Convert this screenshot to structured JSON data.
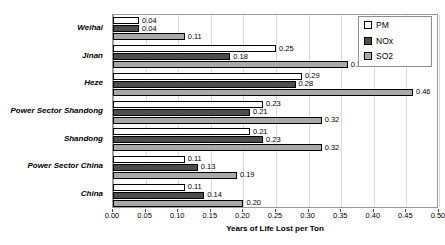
{
  "chart_data": {
    "type": "bar",
    "orientation": "horizontal",
    "title": "",
    "xlabel": "Years of Life Lost per Ton",
    "ylabel": "",
    "xlim": [
      0.0,
      0.5
    ],
    "xticks": [
      "0.00",
      "0.05",
      "0.10",
      "0.15",
      "0.20",
      "0.25",
      "0.30",
      "0.35",
      "0.40",
      "0.45",
      "0.50"
    ],
    "xtick_values": [
      0.0,
      0.05,
      0.1,
      0.15,
      0.2,
      0.25,
      0.3,
      0.35,
      0.4,
      0.45,
      0.5
    ],
    "grid": true,
    "legend_position": "top-right",
    "categories": [
      "Weihai",
      "Jinan",
      "Heze",
      "Power Sector Shandong",
      "Shandong",
      "Power Sector China",
      "China"
    ],
    "series": [
      {
        "name": "PM",
        "color": "#ffffff",
        "values": [
          0.04,
          0.25,
          0.29,
          0.23,
          0.21,
          0.11,
          0.11
        ],
        "labels": [
          "0.04",
          "0.25",
          "0.29",
          "0.23",
          "0.21",
          "0.11",
          "0.11"
        ]
      },
      {
        "name": "NOx",
        "color": "#4d4d4d",
        "values": [
          0.04,
          0.18,
          0.28,
          0.21,
          0.23,
          0.13,
          0.14
        ],
        "labels": [
          "0.04",
          "0.18",
          "0.28",
          "0.21",
          "0.23",
          "0.13",
          "0.14"
        ]
      },
      {
        "name": "SO2",
        "color": "#a9a9a9",
        "values": [
          0.11,
          0.36,
          0.46,
          0.32,
          0.32,
          0.19,
          0.2
        ],
        "labels": [
          "0.11",
          "0.36",
          "0.46",
          "0.32",
          "0.32",
          "0.19",
          "0.20"
        ]
      }
    ]
  },
  "legend": {
    "items": [
      {
        "label": "PM",
        "color": "#ffffff"
      },
      {
        "label": "NOx",
        "color": "#4d4d4d"
      },
      {
        "label": "SO2",
        "color": "#a9a9a9"
      }
    ]
  },
  "axis": {
    "x_title": "Years of Life Lost per Ton"
  }
}
